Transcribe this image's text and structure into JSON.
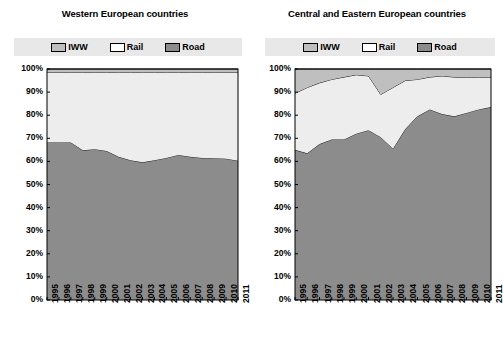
{
  "figure": {
    "background": "#ffffff",
    "legend_background": "#e8e8e8"
  },
  "colors": {
    "iww": "#bfbfbf",
    "rail": "#ededed",
    "road": "#8c8c8c",
    "outline": "#1a1a1a",
    "axis": "#000000"
  },
  "legend": {
    "items": [
      {
        "label": "IWW",
        "color": "#bfbfbf",
        "key": "iww"
      },
      {
        "label": "Rail",
        "color": "#ffffff",
        "key": "rail"
      },
      {
        "label": "Road",
        "color": "#8c8c8c",
        "key": "road"
      }
    ]
  },
  "axis": {
    "y_ticks": [
      "0%",
      "10%",
      "20%",
      "30%",
      "40%",
      "50%",
      "60%",
      "70%",
      "80%",
      "90%",
      "100%"
    ],
    "x_ticks": [
      "1995",
      "1996",
      "1997",
      "1998",
      "1999",
      "2000",
      "2001",
      "2002",
      "2003",
      "2004",
      "2005",
      "2006",
      "2007",
      "2008",
      "2009",
      "2010",
      "2011"
    ]
  },
  "chart_data": [
    {
      "type": "area",
      "id": "western",
      "title": "Western European countries",
      "xlabel": "",
      "ylabel": "",
      "ylim": [
        0,
        100
      ],
      "stacked": true,
      "grid": false,
      "legend_position": "top",
      "categories": [
        "1995",
        "1996",
        "1997",
        "1998",
        "1999",
        "2000",
        "2001",
        "2002",
        "2003",
        "2004",
        "2005",
        "2006",
        "2007",
        "2008",
        "2009",
        "2010",
        "2011"
      ],
      "series": [
        {
          "name": "Road",
          "color": "#8c8c8c",
          "values": [
            68.2,
            68.2,
            68.2,
            64.8,
            65.3,
            64.5,
            62.0,
            60.5,
            59.6,
            60.5,
            61.5,
            62.8,
            62.0,
            61.5,
            61.4,
            61.2,
            60.3
          ]
        },
        {
          "name": "Rail",
          "color": "#ededed",
          "values": [
            30.3,
            30.3,
            30.3,
            33.7,
            33.2,
            34.0,
            36.5,
            38.0,
            38.9,
            38.0,
            37.0,
            35.7,
            36.5,
            37.0,
            37.1,
            37.3,
            38.2
          ]
        },
        {
          "name": "IWW",
          "color": "#bfbfbf",
          "values": [
            1.5,
            1.5,
            1.5,
            1.5,
            1.5,
            1.5,
            1.5,
            1.5,
            1.5,
            1.5,
            1.5,
            1.5,
            1.5,
            1.5,
            1.5,
            1.5,
            1.5
          ]
        }
      ]
    },
    {
      "type": "area",
      "id": "cee",
      "title": "Central and Eastern European countries",
      "xlabel": "",
      "ylabel": "",
      "ylim": [
        0,
        100
      ],
      "stacked": true,
      "grid": false,
      "legend_position": "top",
      "categories": [
        "1995",
        "1996",
        "1997",
        "1998",
        "1999",
        "2000",
        "2001",
        "2002",
        "2003",
        "2004",
        "2005",
        "2006",
        "2007",
        "2008",
        "2009",
        "2010",
        "2011"
      ],
      "series": [
        {
          "name": "Road",
          "color": "#8c8c8c",
          "values": [
            65.0,
            63.5,
            67.5,
            69.5,
            69.5,
            72.0,
            73.5,
            70.5,
            65.5,
            74.0,
            79.5,
            82.5,
            80.5,
            79.5,
            81.0,
            82.5,
            83.5
          ]
        },
        {
          "name": "Rail",
          "color": "#ededed",
          "values": [
            24.5,
            28.5,
            26.5,
            26.0,
            27.0,
            25.5,
            23.5,
            18.5,
            26.5,
            21.0,
            16.0,
            14.0,
            16.5,
            17.0,
            15.5,
            14.0,
            13.0
          ]
        },
        {
          "name": "IWW",
          "color": "#bfbfbf",
          "values": [
            10.5,
            8.0,
            6.0,
            4.5,
            3.5,
            2.5,
            3.0,
            11.0,
            8.0,
            5.0,
            4.5,
            3.5,
            3.0,
            3.5,
            3.5,
            3.5,
            3.5
          ]
        }
      ]
    }
  ]
}
